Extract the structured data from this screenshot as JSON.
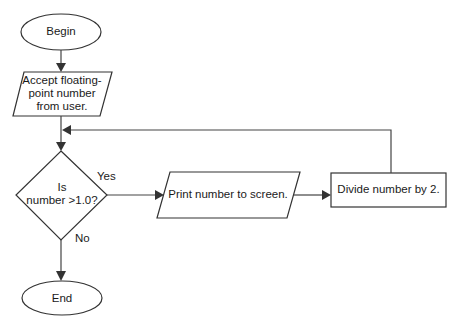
{
  "diagram": {
    "type": "flowchart",
    "nodes": {
      "begin": {
        "shape": "terminator",
        "label": "Begin"
      },
      "input": {
        "shape": "input-output",
        "label_lines": [
          "Accept floating-",
          "point number",
          "from user."
        ]
      },
      "decision": {
        "shape": "decision",
        "label_lines": [
          "Is",
          "number >1.0?"
        ]
      },
      "print": {
        "shape": "input-output",
        "label": "Print number to screen."
      },
      "divide": {
        "shape": "process",
        "label": "Divide number by 2."
      },
      "end": {
        "shape": "terminator",
        "label": "End"
      }
    },
    "edges": {
      "yes_label": "Yes",
      "no_label": "No"
    },
    "colors": {
      "stroke": "#333333",
      "fill": "#ffffff",
      "text": "#1a1a1a"
    }
  }
}
